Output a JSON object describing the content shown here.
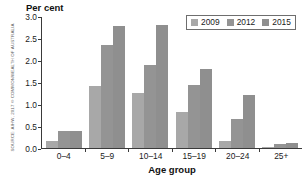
{
  "source_credit": "SOURCE: AIHW, 2017 © COMMONWEALTH OF AUSTRALIA",
  "legend": {
    "items": [
      {
        "label": "2009",
        "color": "#a8a8a8"
      },
      {
        "label": "2012",
        "color": "#949494"
      },
      {
        "label": "2015",
        "color": "#8f8f8f"
      }
    ]
  },
  "chart_data": {
    "type": "bar",
    "title": "",
    "xlabel": "Age group",
    "ylabel": "Per cent",
    "categories": [
      "0–4",
      "5–9",
      "10–14",
      "15–19",
      "20–24",
      "25+"
    ],
    "yticks": [
      "0.0",
      "0.5",
      "1.0",
      "1.5",
      "2.0",
      "2.5",
      "3.0"
    ],
    "ylim": [
      0,
      3.0
    ],
    "grid": false,
    "legend_position": "top-right",
    "series": [
      {
        "name": "2009",
        "color": "#a8a8a8",
        "values": [
          0.17,
          1.4,
          1.26,
          0.82,
          0.17,
          0.02
        ]
      },
      {
        "name": "2012",
        "color": "#949494",
        "values": [
          0.38,
          2.35,
          1.88,
          1.44,
          0.67,
          0.08
        ]
      },
      {
        "name": "2015",
        "color": "#8f8f8f",
        "values": [
          0.38,
          2.78,
          2.79,
          1.8,
          1.2,
          0.11
        ]
      }
    ]
  }
}
